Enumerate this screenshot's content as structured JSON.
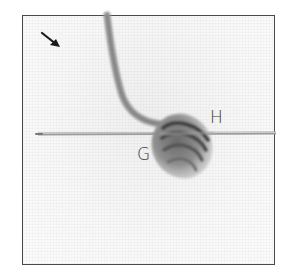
{
  "figure": {
    "labels": {
      "g": "G",
      "h": "H"
    },
    "arrow": {
      "direction": "down-right"
    },
    "colors": {
      "frame_border": "#4a4a4a",
      "background": "#f7f7f7",
      "yarn": "#8a8a8a",
      "yarn_dark": "#4f4f4f",
      "needle": "#9a9a9a",
      "label": "#3a3a3a"
    }
  }
}
